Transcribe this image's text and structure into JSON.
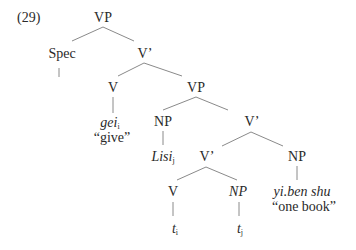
{
  "example_number": "(29)",
  "nodes": {
    "vp_root": "VP",
    "spec": "Spec",
    "vbar_1": "V’",
    "v_head": "V",
    "vp_inner": "VP",
    "np_lisi": "NP",
    "vbar_2": "V’",
    "vbar_3": "V’",
    "np_obj": "NP",
    "v_lower": "V",
    "np_trace": "NP"
  },
  "leaves": {
    "gei": {
      "word": "gei",
      "index": "i",
      "gloss": "“give”"
    },
    "lisi": {
      "word": "Lisi",
      "index": "j"
    },
    "yibenshu": {
      "word": "yi.ben shu",
      "gloss": "“one book”"
    },
    "trace_v": {
      "word": "t",
      "index": "i"
    },
    "trace_np": {
      "word": "t",
      "index": "j"
    }
  }
}
